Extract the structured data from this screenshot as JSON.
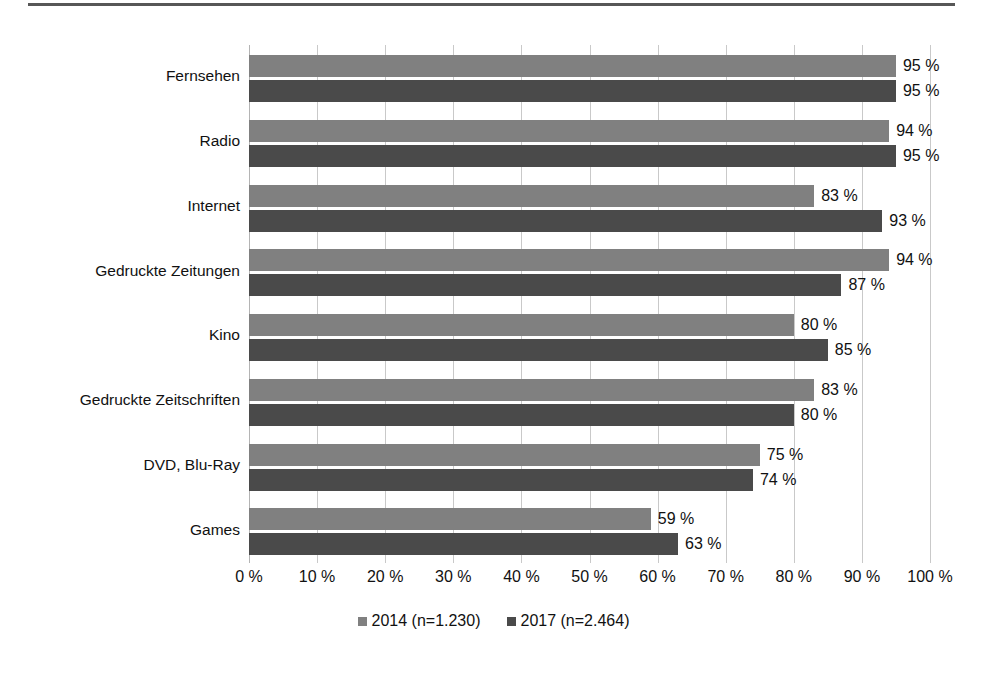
{
  "chart_data": {
    "type": "bar",
    "orientation": "horizontal",
    "title": "",
    "xlabel": "",
    "ylabel": "",
    "xlim": [
      0,
      100
    ],
    "grid": true,
    "legend_position": "bottom",
    "categories": [
      "Fernsehen",
      "Radio",
      "Internet",
      "Gedruckte Zeitungen",
      "Kino",
      "Gedruckte Zeitschriften",
      "DVD, Blu-Ray",
      "Games"
    ],
    "series": [
      {
        "name": "2014 (n=1.230)",
        "color": "#808080",
        "values": [
          95,
          94,
          83,
          94,
          80,
          83,
          75,
          59
        ],
        "labels": [
          "95 %",
          "94 %",
          "83 %",
          "94 %",
          "80 %",
          "83 %",
          "75 %",
          "59 %"
        ]
      },
      {
        "name": "2017 (n=2.464)",
        "color": "#4a4a4a",
        "values": [
          95,
          95,
          93,
          87,
          85,
          80,
          74,
          63
        ],
        "labels": [
          "95 %",
          "95 %",
          "93 %",
          "87 %",
          "85 %",
          "80 %",
          "74 %",
          "63 %"
        ]
      }
    ],
    "xticks": [
      0,
      10,
      20,
      30,
      40,
      50,
      60,
      70,
      80,
      90,
      100
    ],
    "xticklabels": [
      "0 %",
      "10 %",
      "20 %",
      "30 %",
      "40 %",
      "50 %",
      "60 %",
      "70 %",
      "80 %",
      "90 %",
      "100 %"
    ]
  }
}
